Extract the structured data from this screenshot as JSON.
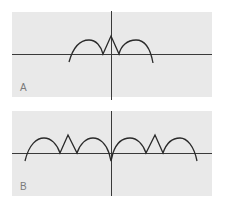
{
  "panels": [
    {
      "id": "A",
      "label": "A",
      "description": "Curve with two arches and a central upward spike",
      "background": "#e9e9e9",
      "curve_color": "#2a2a2a",
      "axis_color": "#3a3a3a"
    },
    {
      "id": "B",
      "label": "B",
      "description": "Periodic curve with arches, upward spikes, and a central downward cusp",
      "background": "#e9e9e9",
      "curve_color": "#2a2a2a",
      "axis_color": "#3a3a3a"
    }
  ]
}
